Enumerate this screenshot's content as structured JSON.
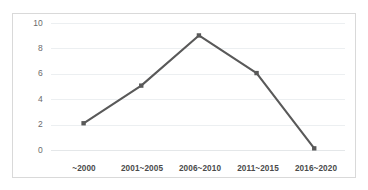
{
  "chart_data": {
    "type": "line",
    "title": "",
    "subtitle": "",
    "xlabel": "",
    "ylabel": "",
    "categories": [
      "~2000",
      "2001~2005",
      "2006~2010",
      "2011~2015",
      "2016~2020"
    ],
    "values": [
      2,
      5,
      9,
      6,
      0
    ],
    "series": [
      {
        "name": "",
        "values": [
          2,
          5,
          9,
          6,
          0
        ]
      }
    ],
    "ylim": [
      0,
      10
    ],
    "ytick_values": [
      0,
      2,
      4,
      6,
      8,
      10
    ],
    "ytick_labels": [
      "0",
      "2",
      "4",
      "6",
      "8",
      "10"
    ],
    "grid": true,
    "grid_axis": "y",
    "legend": false,
    "legend_position": "none",
    "markers": "square",
    "annotations": []
  },
  "style": {
    "line_color": "#595959",
    "marker_color": "#595959",
    "gridline_color": "#eceff1",
    "border_color": "#d9d9d9",
    "plot_background": "#ffffff",
    "page_background": "#ffffff",
    "ytick_color": "#6b6b6b",
    "xtick_color": "#4a4a4a"
  }
}
